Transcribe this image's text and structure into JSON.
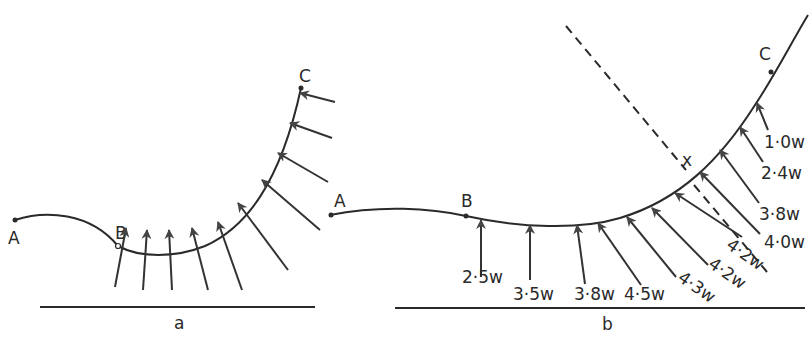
{
  "figure_a": {
    "caption": "a",
    "points": {
      "A": "A",
      "B": "B",
      "C": "C"
    }
  },
  "figure_b": {
    "caption": "b",
    "points": {
      "A": "A",
      "B": "B",
      "C": "C",
      "X": "x"
    },
    "force_labels": [
      "2·5w",
      "3·5w",
      "3·8w",
      "4·5w",
      "4·3w",
      "4·2w",
      "4·2w",
      "4·0w",
      "3·8w",
      "2·4w",
      "1·0w"
    ]
  },
  "colors": {
    "ink": "#2a2a2a",
    "background": "#ffffff"
  }
}
